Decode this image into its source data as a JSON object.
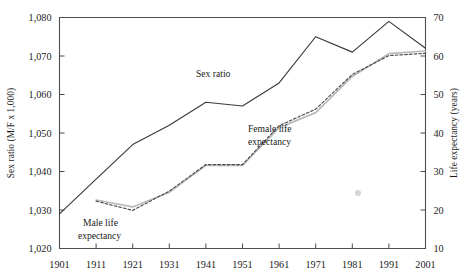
{
  "chart_data": {
    "type": "line",
    "title": "",
    "subtitle": "",
    "xlabel": "",
    "x": [
      1901,
      1911,
      1921,
      1931,
      1941,
      1951,
      1961,
      1971,
      1981,
      1991,
      2001
    ],
    "xticklabels": [
      "1901",
      "1911",
      "1921",
      "1931",
      "1941",
      "1951",
      "1961",
      "1971",
      "1981",
      "1991",
      "2001"
    ],
    "grid": false,
    "legend_position": "inline-annotations",
    "axes": [
      {
        "id": "left",
        "label": "Sex ratio (M/F x 1,000)",
        "lim": [
          1020,
          1080
        ],
        "ticks": [
          1020,
          1030,
          1040,
          1050,
          1060,
          1070,
          1080
        ],
        "ticklabels": [
          "1,020",
          "1,030",
          "1,040",
          "1,050",
          "1,060",
          "1,070",
          "1,080"
        ]
      },
      {
        "id": "right",
        "label": "Life expectancy (years)",
        "lim": [
          10,
          70
        ],
        "ticks": [
          10,
          20,
          30,
          40,
          50,
          60,
          70
        ],
        "ticklabels": [
          "10",
          "20",
          "30",
          "40",
          "50",
          "60",
          "70"
        ]
      }
    ],
    "series": [
      {
        "name": "Sex ratio",
        "axis": "left",
        "style": "solid",
        "color": "#3a3a3a",
        "x": [
          1901,
          1911,
          1921,
          1931,
          1941,
          1951,
          1961,
          1971,
          1981,
          1991,
          2001
        ],
        "values": [
          1029,
          1038,
          1047,
          1052,
          1058,
          1057,
          1063,
          1075,
          1071,
          1079,
          1072
        ]
      },
      {
        "name": "Female life expectancy",
        "axis": "right",
        "style": "solid",
        "color": "#b9b9b9",
        "x": [
          1911,
          1921,
          1931,
          1941,
          1951,
          1961,
          1971,
          1981,
          1991,
          2001
        ],
        "values": [
          22.6,
          20.8,
          24.6,
          31.6,
          31.6,
          41.4,
          45.3,
          54.7,
          60.6,
          61.3
        ]
      },
      {
        "name": "Male life expectancy",
        "axis": "right",
        "style": "dashed",
        "color": "#4a4a4a",
        "x": [
          1911,
          1921,
          1931,
          1941,
          1951,
          1961,
          1971,
          1981,
          1991,
          2001
        ],
        "values": [
          22.3,
          19.9,
          24.9,
          31.8,
          31.8,
          41.9,
          46.2,
          55.2,
          60.1,
          60.7
        ]
      }
    ],
    "annotations": [
      {
        "name": "sex-ratio-label",
        "text": "Sex ratio",
        "x": 1950.5,
        "y_axis": "left",
        "y": 1063.5
      },
      {
        "name": "female-life-expectancy-label",
        "text": "Female life\nexpectancy",
        "x": 1975,
        "y_axis": "right",
        "y": 36.5
      },
      {
        "name": "male-life-expectancy-label",
        "text": "Male life\nexpectancy",
        "x": 1919,
        "y_axis": "right",
        "y": 16.5
      }
    ],
    "marks": [
      {
        "name": "gray-dot-artifact",
        "shape": "circle",
        "color": "#c9c9c9",
        "px": 358,
        "py": 193,
        "r": 3.1
      }
    ]
  },
  "labels": {
    "left_axis_title": "Sex ratio (M/F x 1,000)",
    "right_axis_title": "Life expectancy (years)",
    "sex_ratio": "Sex ratio",
    "female_life_1": "Female life",
    "female_life_2": "expectancy",
    "male_life_1": "Male life",
    "male_life_2": "expectancy"
  },
  "colors": {
    "frame": "#4d4d4d",
    "sex_ratio_line": "#3a3a3a",
    "female_line": "#b9b9b9",
    "male_line": "#4a4a4a",
    "text": "#1a1a1a",
    "background": "#ffffff"
  }
}
